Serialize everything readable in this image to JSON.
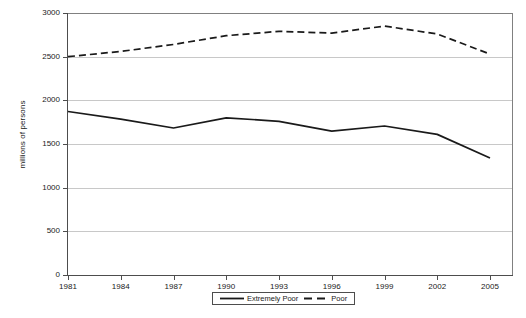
{
  "chart_data": {
    "type": "line",
    "title": "",
    "xlabel": "",
    "ylabel": "millions of persons",
    "ylim": [
      0,
      3000
    ],
    "ytick_values": [
      0,
      500,
      1000,
      1500,
      2000,
      2500,
      3000
    ],
    "ytick_labels": [
      "0",
      "500",
      "1000",
      "1500",
      "2000",
      "2500",
      "3000"
    ],
    "grid": true,
    "legend_position": "bottom-center",
    "xlim": [
      1981,
      2005
    ],
    "xtick_labels": [
      "1981",
      "1984",
      "1987",
      "1990",
      "1993",
      "1996",
      "1999",
      "2002",
      "2005"
    ],
    "x": [
      1981,
      1984,
      1987,
      1990,
      1993,
      1996,
      1999,
      2002,
      2005
    ],
    "series": [
      {
        "name": "Extremely Poor",
        "style": "solid",
        "color": "#1a1a1a",
        "values": [
          1872,
          1785,
          1683,
          1800,
          1760,
          1648,
          1706,
          1610,
          1340
        ]
      },
      {
        "name": "Poor",
        "style": "dashed",
        "color": "#1a1a1a",
        "values": [
          2500,
          2560,
          2640,
          2740,
          2790,
          2770,
          2850,
          2760,
          2530
        ]
      }
    ]
  },
  "legend": {
    "entries": [
      {
        "label": "Extremely Poor"
      },
      {
        "label": "Poor"
      }
    ]
  }
}
